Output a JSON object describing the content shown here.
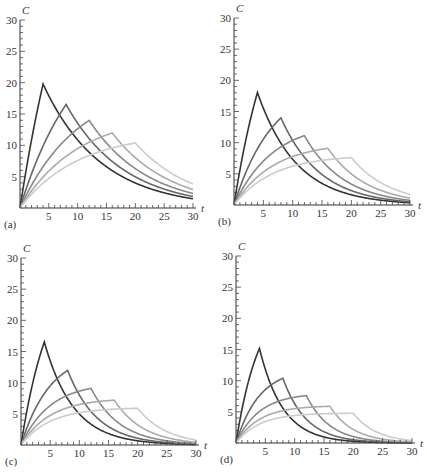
{
  "chart_data": [
    {
      "type": "line",
      "panel_label": "(a)",
      "xlabel": "t",
      "ylabel": "C",
      "xlim": [
        0,
        30
      ],
      "ylim": [
        0,
        30
      ],
      "xticks": [
        5,
        10,
        15,
        20,
        25,
        30
      ],
      "yticks": [
        5,
        10,
        15,
        20,
        25,
        30
      ],
      "grid": false,
      "model": {
        "dose": 24,
        "k": 0.1,
        "infusion_durations": [
          4,
          8,
          12,
          16,
          20
        ]
      },
      "series": [
        {
          "name": "T=4",
          "color": "#333333",
          "peak": {
            "t": 4,
            "C": 19.8
          },
          "end_value": 1.5
        },
        {
          "name": "T=8",
          "color": "#666666",
          "peak": {
            "t": 8,
            "C": 16.5
          },
          "end_value": 1.8
        },
        {
          "name": "T=12",
          "color": "#888888",
          "peak": {
            "t": 12,
            "C": 14.0
          },
          "end_value": 2.3
        },
        {
          "name": "T=16",
          "color": "#aaaaaa",
          "peak": {
            "t": 16,
            "C": 12.0
          },
          "end_value": 2.9
        },
        {
          "name": "T=20",
          "color": "#cccccc",
          "peak": {
            "t": 20,
            "C": 10.4
          },
          "end_value": 3.8
        }
      ]
    },
    {
      "type": "line",
      "panel_label": "(b)",
      "xlabel": "t",
      "ylabel": "C",
      "xlim": [
        0,
        30
      ],
      "ylim": [
        0,
        30
      ],
      "xticks": [
        5,
        10,
        15,
        20,
        25,
        30
      ],
      "yticks": [
        5,
        10,
        15,
        20,
        25,
        30
      ],
      "grid": false,
      "model": {
        "dose": 24,
        "k": 0.15,
        "infusion_durations": [
          4,
          8,
          12,
          16,
          20
        ]
      },
      "series": [
        {
          "name": "T=4",
          "color": "#333333",
          "peak": {
            "t": 4,
            "C": 18.0
          },
          "end_value": 0.4
        },
        {
          "name": "T=8",
          "color": "#666666",
          "peak": {
            "t": 8,
            "C": 14.0
          },
          "end_value": 0.5
        },
        {
          "name": "T=12",
          "color": "#888888",
          "peak": {
            "t": 12,
            "C": 11.2
          },
          "end_value": 0.8
        },
        {
          "name": "T=16",
          "color": "#aaaaaa",
          "peak": {
            "t": 16,
            "C": 9.2
          },
          "end_value": 1.1
        },
        {
          "name": "T=20",
          "color": "#cccccc",
          "peak": {
            "t": 20,
            "C": 7.7
          },
          "end_value": 1.7
        }
      ]
    },
    {
      "type": "line",
      "panel_label": "(c)",
      "xlabel": "t",
      "ylabel": "C",
      "xlim": [
        0,
        30
      ],
      "ylim": [
        0,
        30
      ],
      "xticks": [
        5,
        10,
        15,
        20,
        25,
        30
      ],
      "yticks": [
        5,
        10,
        15,
        20,
        25,
        30
      ],
      "grid": false,
      "model": {
        "dose": 24,
        "k": 0.2,
        "infusion_durations": [
          4,
          8,
          12,
          16,
          20
        ]
      },
      "series": [
        {
          "name": "T=4",
          "color": "#333333",
          "peak": {
            "t": 4,
            "C": 16.4
          },
          "end_value": 0.1
        },
        {
          "name": "T=8",
          "color": "#666666",
          "peak": {
            "t": 8,
            "C": 12.0
          },
          "end_value": 0.2
        },
        {
          "name": "T=12",
          "color": "#888888",
          "peak": {
            "t": 12,
            "C": 9.2
          },
          "end_value": 0.3
        },
        {
          "name": "T=16",
          "color": "#aaaaaa",
          "peak": {
            "t": 16,
            "C": 7.2
          },
          "end_value": 0.5
        },
        {
          "name": "T=20",
          "color": "#cccccc",
          "peak": {
            "t": 20,
            "C": 6.0
          },
          "end_value": 0.8
        }
      ]
    },
    {
      "type": "line",
      "panel_label": "(d)",
      "xlabel": "t",
      "ylabel": "C",
      "xlim": [
        0,
        30
      ],
      "ylim": [
        0,
        30
      ],
      "xticks": [
        5,
        10,
        15,
        20,
        25,
        30
      ],
      "yticks": [
        5,
        10,
        15,
        20,
        25,
        30
      ],
      "grid": false,
      "model": {
        "dose": 24,
        "k": 0.25,
        "infusion_durations": [
          4,
          8,
          12,
          16,
          20
        ]
      },
      "series": [
        {
          "name": "T=4",
          "color": "#333333",
          "peak": {
            "t": 4,
            "C": 15.1
          },
          "end_value": 0.0
        },
        {
          "name": "T=8",
          "color": "#666666",
          "peak": {
            "t": 8,
            "C": 10.4
          },
          "end_value": 0.1
        },
        {
          "name": "T=12",
          "color": "#888888",
          "peak": {
            "t": 12,
            "C": 7.7
          },
          "end_value": 0.1
        },
        {
          "name": "T=16",
          "color": "#aaaaaa",
          "peak": {
            "t": 16,
            "C": 6.0
          },
          "end_value": 0.3
        },
        {
          "name": "T=20",
          "color": "#cccccc",
          "peak": {
            "t": 20,
            "C": 5.0
          },
          "end_value": 0.5
        }
      ]
    }
  ],
  "layout": {
    "panels": [
      {
        "x0": 20,
        "y0": 208,
        "x1": 193,
        "y1": 20
      },
      {
        "x0": 234,
        "y0": 205,
        "x1": 410,
        "y1": 18
      },
      {
        "x0": 21,
        "y0": 445,
        "x1": 196,
        "y1": 258
      },
      {
        "x0": 236,
        "y0": 443,
        "x1": 412,
        "y1": 256
      }
    ]
  }
}
